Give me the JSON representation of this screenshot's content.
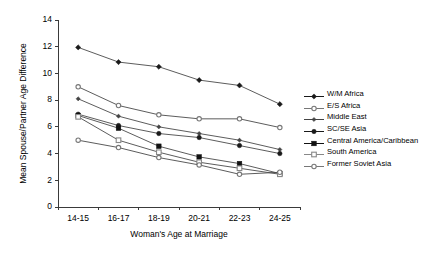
{
  "chart_data": {
    "type": "line",
    "title": "",
    "xlabel": "Woman's Age at Marriage",
    "ylabel": "Mean Spouse/Partner Age Difference",
    "categories": [
      "14-15",
      "16-17",
      "18-19",
      "20-21",
      "22-23",
      "24-25"
    ],
    "ylim": [
      0,
      14
    ],
    "yticks": [
      0,
      2,
      4,
      6,
      8,
      10,
      12,
      14
    ],
    "grid": false,
    "legend_position": "right",
    "series": [
      {
        "name": "W/M Africa",
        "marker": "filled-diamond",
        "color": "#1a1a1a",
        "values": [
          11.95,
          10.85,
          10.5,
          9.5,
          9.1,
          7.7
        ]
      },
      {
        "name": "E/S Africa",
        "marker": "open-circle",
        "color": "#777777",
        "values": [
          9.0,
          7.6,
          6.9,
          6.6,
          6.6,
          5.95
        ]
      },
      {
        "name": "Middle East",
        "marker": "filled-diamond-small",
        "color": "#444444",
        "values": [
          8.1,
          6.8,
          6.0,
          5.5,
          5.0,
          4.3
        ]
      },
      {
        "name": "SC/SE Asia",
        "marker": "filled-circle",
        "color": "#1a1a1a",
        "values": [
          6.95,
          6.1,
          5.5,
          5.2,
          4.6,
          4.0
        ]
      },
      {
        "name": "Central America/Caribbean",
        "marker": "filled-square",
        "color": "#111111",
        "values": [
          6.85,
          5.9,
          4.55,
          3.75,
          3.25,
          2.5
        ]
      },
      {
        "name": "South America",
        "marker": "open-square",
        "color": "#888888",
        "values": [
          6.75,
          5.0,
          4.1,
          3.35,
          2.9,
          2.45
        ]
      },
      {
        "name": "Former Soviet Asia",
        "marker": "open-circle",
        "color": "#777777",
        "values": [
          5.0,
          4.45,
          3.7,
          3.15,
          2.45,
          2.6
        ]
      }
    ]
  },
  "axes": {
    "y_tick_labels": [
      "0",
      "2",
      "4",
      "6",
      "8",
      "10",
      "12",
      "14"
    ],
    "x_tick_labels": [
      "14-15",
      "16-17",
      "18-19",
      "20-21",
      "22-23",
      "24-25"
    ],
    "y_axis_title": "Mean Spouse/Partner Age Difference",
    "x_axis_title": "Woman's Age at Marriage"
  },
  "legend": {
    "entries": [
      {
        "label": "W/M Africa"
      },
      {
        "label": "E/S Africa"
      },
      {
        "label": "Middle East"
      },
      {
        "label": "SC/SE Asia"
      },
      {
        "label": "Central America/Caribbean"
      },
      {
        "label": "South America"
      },
      {
        "label": "Former Soviet Asia"
      }
    ]
  }
}
